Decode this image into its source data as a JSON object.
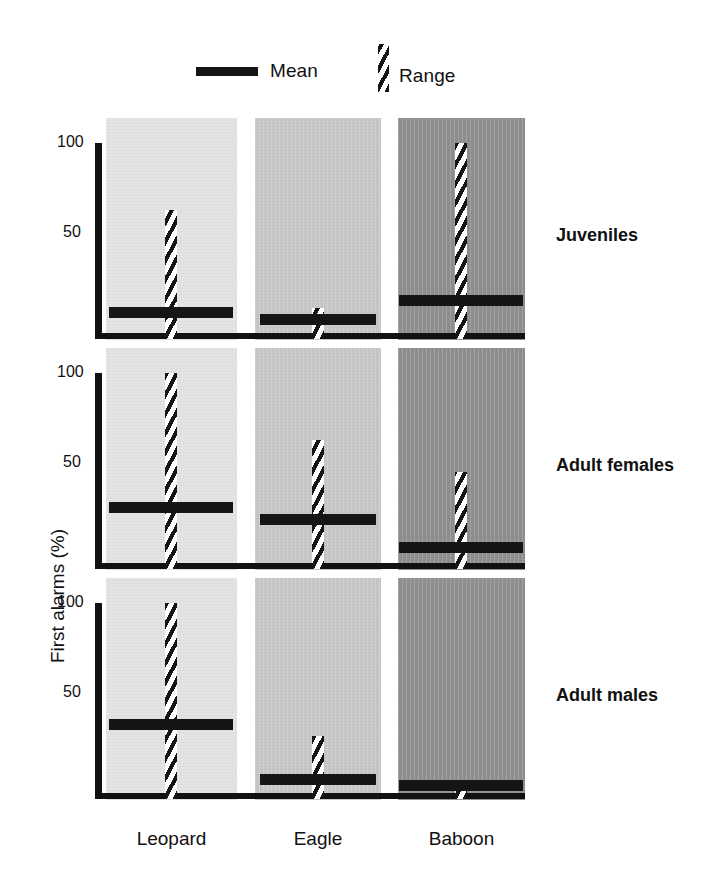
{
  "chart_data": {
    "type": "bar",
    "title": "",
    "xlabel": "",
    "ylabel": "First alarms (%)",
    "ylim": [
      0,
      100
    ],
    "yticks": [
      50,
      100
    ],
    "ytick_labels": [
      "50",
      "100"
    ],
    "grid": false,
    "legend_position": "top",
    "legend": [
      {
        "key": "mean",
        "label": "Mean",
        "style": "solid-horizontal-bar",
        "color": "#151515"
      },
      {
        "key": "range",
        "label": "Range",
        "style": "hatched-vertical-bar",
        "color": "#151515"
      }
    ],
    "categories": [
      "Leopard",
      "Eagle",
      "Baboon"
    ],
    "category_colors": [
      "#e2e2e2",
      "#c6c6c6",
      "#8e8e8e"
    ],
    "panels": [
      {
        "name": "Juveniles",
        "bars": [
          {
            "category": "Leopard",
            "mean": 11,
            "range_min": 0,
            "range_max": 65
          },
          {
            "category": "Eagle",
            "mean": 7,
            "range_min": 0,
            "range_max": 13
          },
          {
            "category": "Baboon",
            "mean": 17,
            "range_min": 0,
            "range_max": 100
          }
        ]
      },
      {
        "name": "Adult females",
        "bars": [
          {
            "category": "Leopard",
            "mean": 29,
            "range_min": 0,
            "range_max": 100
          },
          {
            "category": "Eagle",
            "mean": 23,
            "range_min": 0,
            "range_max": 65
          },
          {
            "category": "Baboon",
            "mean": 8,
            "range_min": 0,
            "range_max": 48
          }
        ]
      },
      {
        "name": "Adult males",
        "bars": [
          {
            "category": "Leopard",
            "mean": 36,
            "range_min": 0,
            "range_max": 100
          },
          {
            "category": "Eagle",
            "mean": 7,
            "range_min": 0,
            "range_max": 30
          },
          {
            "category": "Baboon",
            "mean": 4,
            "range_min": 0,
            "range_max": 7
          }
        ]
      }
    ]
  },
  "axis": {
    "tick_100": "100",
    "tick_50": "50",
    "y_title": "First alarms (%)"
  },
  "legend": {
    "mean_label": "Mean",
    "range_label": "Range"
  },
  "panels": [
    {
      "label": "Juveniles"
    },
    {
      "label": "Adult females"
    },
    {
      "label": "Adult males"
    }
  ],
  "categories": [
    {
      "label": "Leopard"
    },
    {
      "label": "Eagle"
    },
    {
      "label": "Baboon"
    }
  ]
}
